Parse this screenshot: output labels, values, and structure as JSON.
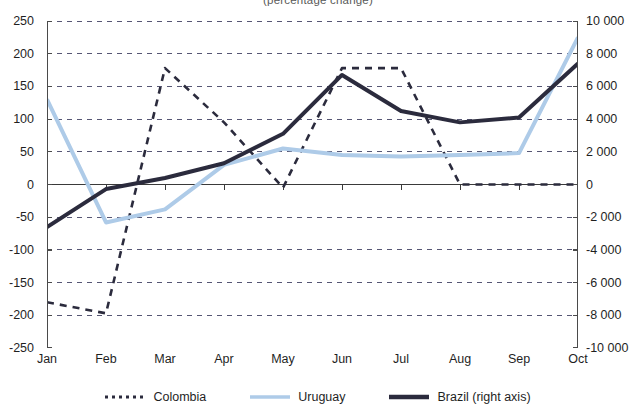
{
  "chart_data": {
    "type": "line",
    "title": "(percentage change)",
    "categories": [
      "Jan",
      "Feb",
      "Mar",
      "Apr",
      "May",
      "Jun",
      "Jul",
      "Aug",
      "Sep",
      "Oct"
    ],
    "series": [
      {
        "name": "Colombia",
        "axis": "left",
        "style": "dashed",
        "color": "#2b2b3d",
        "values": [
          -180,
          -197,
          178,
          95,
          -5,
          178,
          178,
          0,
          0,
          0
        ]
      },
      {
        "name": "Uruguay",
        "axis": "left",
        "style": "solid",
        "color": "#aecbe8",
        "values": [
          130,
          -58,
          -38,
          30,
          55,
          45,
          43,
          45,
          48,
          225
        ]
      },
      {
        "name": "Brazil (right axis)",
        "axis": "right",
        "style": "thick",
        "color": "#2b2b3d",
        "values": [
          -2600,
          -280,
          400,
          1300,
          3100,
          6700,
          4500,
          3800,
          4100,
          7400
        ]
      }
    ],
    "left_axis": {
      "label": "",
      "min": -250,
      "max": 250,
      "step": 50,
      "ticks": [
        "250",
        "200",
        "150",
        "100",
        "50",
        "0",
        "-50",
        "-100",
        "-150",
        "-200",
        "-250"
      ]
    },
    "right_axis": {
      "label": "",
      "min": -10000,
      "max": 10000,
      "step": 2000,
      "ticks": [
        "10 000",
        "8 000",
        "6 000",
        "4 000",
        "2 000",
        "0",
        "-2 000",
        "-4 000",
        "-6 000",
        "-8 000",
        "-10 000"
      ]
    },
    "xlabel": "",
    "grid": "horizontal-dashed",
    "zero_line": true,
    "legend_position": "bottom"
  },
  "legend": {
    "items": [
      {
        "label": "Colombia",
        "icon": "dashed-line-swatch"
      },
      {
        "label": "Uruguay",
        "icon": "solid-line-swatch"
      },
      {
        "label": "Brazil (right axis)",
        "icon": "thick-line-swatch"
      }
    ]
  },
  "colors": {
    "colombia": "#2b2b3d",
    "uruguay": "#aecbe8",
    "brazil": "#2b2b3d",
    "grid": "#3a3a5c",
    "axis": "#4a4a4a"
  }
}
